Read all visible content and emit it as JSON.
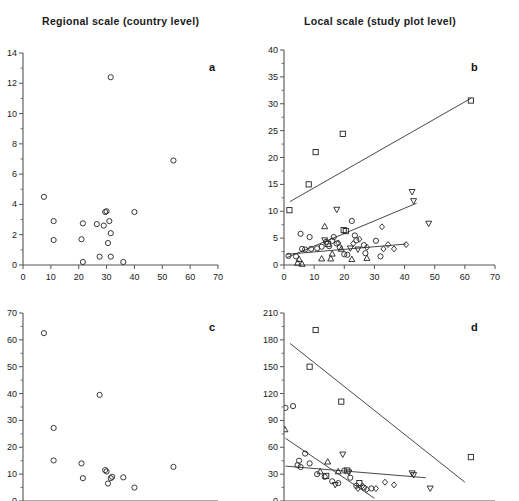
{
  "figure": {
    "column_titles": [
      "Regional scale (country level)",
      "Local scale (study plot level)"
    ],
    "panel_labels": [
      "a",
      "b",
      "c",
      "d"
    ],
    "note": "Four-panel scatter figure; bottom row is cropped by the screenshot edge."
  },
  "chart_data": [
    {
      "id": "a",
      "type": "scatter",
      "title": "Regional scale (country level)",
      "panel_label": "a",
      "xlabel": "",
      "ylabel": "",
      "xlim": [
        0,
        70
      ],
      "ylim": [
        0,
        14
      ],
      "xticks": [
        0,
        10,
        20,
        30,
        40,
        50,
        60,
        70
      ],
      "yticks": [
        0,
        2,
        4,
        6,
        8,
        10,
        12,
        14
      ],
      "grid": false,
      "legend": false,
      "series": [
        {
          "name": "circles",
          "marker": "circle",
          "points": [
            [
              7.5,
              4.5
            ],
            [
              11,
              2.9
            ],
            [
              11,
              1.65
            ],
            [
              21.5,
              2.75
            ],
            [
              21,
              1.7
            ],
            [
              21.5,
              0.2
            ],
            [
              26.5,
              2.7
            ],
            [
              27.5,
              0.55
            ],
            [
              29.5,
              3.5
            ],
            [
              30,
              3.55
            ],
            [
              29,
              2.6
            ],
            [
              30.5,
              1.45
            ],
            [
              31,
              2.9
            ],
            [
              31.5,
              2.1
            ],
            [
              31.5,
              12.4
            ],
            [
              31.5,
              0.55
            ],
            [
              36,
              0.2
            ],
            [
              40,
              3.5
            ],
            [
              54,
              6.9
            ]
          ]
        }
      ],
      "fits": []
    },
    {
      "id": "b",
      "type": "scatter",
      "title": "Local scale (study plot level)",
      "panel_label": "b",
      "xlabel": "",
      "ylabel": "",
      "xlim": [
        0,
        70
      ],
      "ylim": [
        0,
        40
      ],
      "xticks": [
        0,
        10,
        20,
        30,
        40,
        50,
        60,
        70
      ],
      "yticks": [
        0,
        5,
        10,
        15,
        20,
        25,
        30,
        35,
        40
      ],
      "grid": false,
      "legend": false,
      "series": [
        {
          "name": "squares",
          "marker": "square",
          "points": [
            [
              1.8,
              10.2
            ],
            [
              8.2,
              15.0
            ],
            [
              10.5,
              21.0
            ],
            [
              19.5,
              24.4
            ],
            [
              14.5,
              3.9
            ],
            [
              19.8,
              6.5
            ],
            [
              20.5,
              6.3
            ],
            [
              62.0,
              30.6
            ]
          ]
        },
        {
          "name": "down-triangles",
          "marker": "triangle-down",
          "points": [
            [
              17.5,
              10.3
            ],
            [
              42.5,
              13.6
            ],
            [
              43.0,
              11.9
            ],
            [
              48.0,
              7.7
            ],
            [
              13.5,
              4.6
            ],
            [
              22.0,
              3.1
            ],
            [
              24.5,
              2.9
            ]
          ]
        },
        {
          "name": "circles",
          "marker": "circle",
          "points": [
            [
              1.5,
              1.7
            ],
            [
              4.0,
              1.6
            ],
            [
              5.5,
              5.8
            ],
            [
              6.0,
              3.0
            ],
            [
              7.0,
              2.9
            ],
            [
              8.5,
              5.2
            ],
            [
              9.0,
              3.0
            ],
            [
              11.0,
              3.1
            ],
            [
              12.5,
              3.4
            ],
            [
              14.0,
              4.3
            ],
            [
              15.0,
              3.5
            ],
            [
              16.0,
              4.5
            ],
            [
              16.5,
              5.2
            ],
            [
              17.5,
              4.0
            ],
            [
              18.5,
              3.3
            ],
            [
              20.0,
              2.0
            ],
            [
              21.0,
              1.9
            ],
            [
              22.5,
              8.2
            ],
            [
              23.5,
              5.5
            ],
            [
              24.0,
              4.6
            ],
            [
              26.5,
              3.7
            ],
            [
              27.0,
              2.2
            ],
            [
              30.5,
              4.5
            ],
            [
              32.0,
              1.6
            ]
          ]
        },
        {
          "name": "up-triangles",
          "marker": "triangle-up",
          "points": [
            [
              4.5,
              0.4
            ],
            [
              6.0,
              0.2
            ],
            [
              5.0,
              1.1
            ],
            [
              12.5,
              1.2
            ],
            [
              13.5,
              7.2
            ],
            [
              15.5,
              1.2
            ],
            [
              16.0,
              2.1
            ],
            [
              19.0,
              3.0
            ],
            [
              22.5,
              1.1
            ],
            [
              27.5,
              1.3
            ]
          ]
        },
        {
          "name": "diamonds",
          "marker": "diamond",
          "points": [
            [
              18.0,
              4.1
            ],
            [
              23.0,
              4.0
            ],
            [
              25.0,
              4.8
            ],
            [
              27.5,
              3.3
            ],
            [
              32.5,
              7.1
            ],
            [
              33.0,
              3.0
            ],
            [
              34.5,
              3.8
            ],
            [
              36.5,
              3.0
            ],
            [
              40.5,
              3.8
            ]
          ]
        }
      ],
      "fits": [
        {
          "name": "upper-fit",
          "x1": 2.0,
          "y1": 11.8,
          "x2": 62.0,
          "y2": 31.0
        },
        {
          "name": "middle-fit",
          "x1": 1.0,
          "y1": 1.4,
          "x2": 44.0,
          "y2": 11.5
        },
        {
          "name": "lower-fit",
          "x1": 1.0,
          "y1": 2.0,
          "x2": 40.5,
          "y2": 3.9
        }
      ]
    },
    {
      "id": "c",
      "type": "scatter",
      "title": "Regional scale (country level)",
      "panel_label": "c",
      "xlabel": "",
      "ylabel": "",
      "xlim": [
        0,
        70
      ],
      "ylim": [
        0,
        70
      ],
      "xticks": [
        0,
        10,
        20,
        30,
        40,
        50,
        60,
        70
      ],
      "yticks": [
        0,
        10,
        20,
        30,
        40,
        50,
        60,
        70
      ],
      "grid": false,
      "legend": false,
      "cropped": true,
      "series": [
        {
          "name": "circles",
          "marker": "circle",
          "points": [
            [
              7.5,
              62.5
            ],
            [
              11.0,
              27.2
            ],
            [
              11.0,
              15.1
            ],
            [
              21.0,
              14.0
            ],
            [
              21.5,
              8.5
            ],
            [
              27.5,
              39.5
            ],
            [
              29.5,
              11.5
            ],
            [
              30.0,
              11.0
            ],
            [
              30.5,
              6.5
            ],
            [
              31.5,
              8.5
            ],
            [
              32.0,
              9.0
            ],
            [
              36.0,
              8.8
            ],
            [
              40.0,
              5.0
            ],
            [
              54.0,
              12.7
            ]
          ]
        }
      ],
      "fits": []
    },
    {
      "id": "d",
      "type": "scatter",
      "title": "Local scale (study plot level)",
      "panel_label": "d",
      "xlabel": "",
      "ylabel": "",
      "xlim": [
        0,
        70
      ],
      "ylim": [
        0,
        210
      ],
      "xticks": [
        0,
        10,
        20,
        30,
        40,
        50,
        60,
        70
      ],
      "yticks": [
        0,
        30,
        60,
        90,
        120,
        150,
        180,
        210
      ],
      "grid": false,
      "legend": false,
      "cropped": true,
      "series": [
        {
          "name": "squares",
          "marker": "square",
          "points": [
            [
              10.5,
              191.0
            ],
            [
              8.5,
              150.0
            ],
            [
              19.0,
              111.0
            ],
            [
              62.0,
              49.0
            ],
            [
              14.0,
              28.0
            ],
            [
              21.0,
              34.0
            ],
            [
              25.0,
              20.0
            ]
          ]
        },
        {
          "name": "circles",
          "marker": "circle",
          "points": [
            [
              0.5,
              104.0
            ],
            [
              3.0,
              106.0
            ],
            [
              7.0,
              53.0
            ],
            [
              5.0,
              45.0
            ],
            [
              4.5,
              40.0
            ],
            [
              5.5,
              38.0
            ],
            [
              8.5,
              42.0
            ],
            [
              11.0,
              30.0
            ],
            [
              13.5,
              27.0
            ],
            [
              16.0,
              22.0
            ],
            [
              18.0,
              20.0
            ],
            [
              20.0,
              34.0
            ],
            [
              22.0,
              26.0
            ],
            [
              24.0,
              17.0
            ],
            [
              26.5,
              15.0
            ],
            [
              29.0,
              14.0
            ]
          ]
        },
        {
          "name": "up-triangles",
          "marker": "triangle-up",
          "points": [
            [
              0.3,
              80.0
            ],
            [
              14.5,
              44.0
            ],
            [
              18.0,
              33.0
            ],
            [
              12.0,
              33.0
            ]
          ]
        },
        {
          "name": "down-triangles",
          "marker": "triangle-down",
          "points": [
            [
              19.5,
              52.0
            ],
            [
              21.5,
              32.0
            ],
            [
              42.5,
              31.0
            ],
            [
              43.0,
              29.0
            ],
            [
              48.5,
              14.0
            ],
            [
              17.0,
              18.0
            ]
          ]
        },
        {
          "name": "diamonds",
          "marker": "diamond",
          "points": [
            [
              26.0,
              17.0
            ],
            [
              30.5,
              14.0
            ],
            [
              33.5,
              21.0
            ],
            [
              36.5,
              18.0
            ],
            [
              27.5,
              13.0
            ],
            [
              24.5,
              14.0
            ]
          ]
        }
      ],
      "fits": [
        {
          "name": "upper-fit",
          "x1": 2.0,
          "y1": 176.0,
          "x2": 60.0,
          "y2": 21.0
        },
        {
          "name": "middle-fit",
          "x1": 0.5,
          "y1": 70.0,
          "x2": 30.0,
          "y2": 3.0
        },
        {
          "name": "lower-fit",
          "x1": 0.5,
          "y1": 39.0,
          "x2": 47.0,
          "y2": 26.0
        }
      ]
    }
  ]
}
